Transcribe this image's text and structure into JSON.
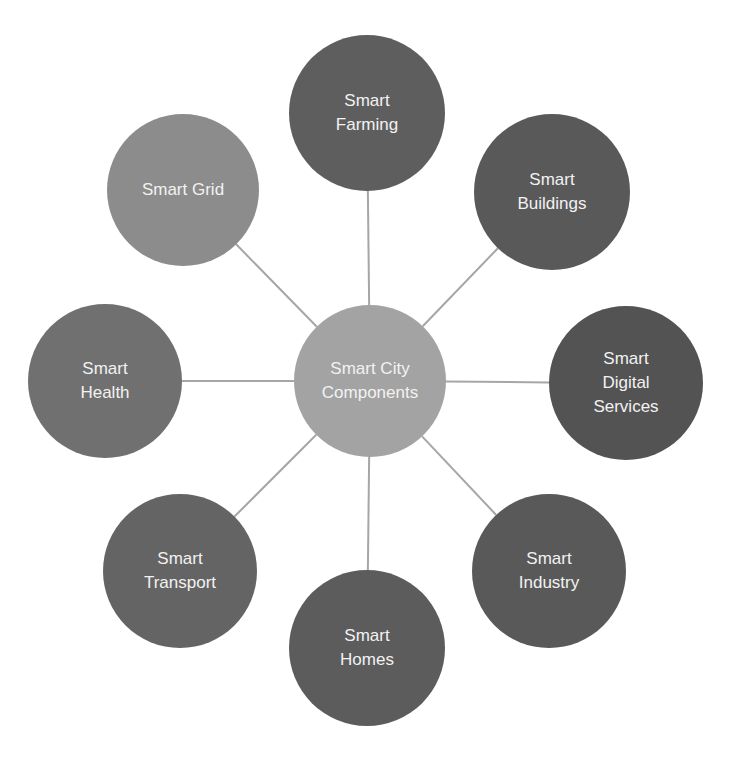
{
  "diagram": {
    "type": "hub-and-spoke",
    "center": {
      "label": "Smart City\nComponents",
      "cx": 370,
      "cy": 381,
      "r": 76,
      "color": "#a3a3a3"
    },
    "line_color": "#a6a6a6",
    "nodes": [
      {
        "id": "farming",
        "label": "Smart\nFarming",
        "cx": 367,
        "cy": 113,
        "r": 78,
        "color": "#5e5e5e"
      },
      {
        "id": "buildings",
        "label": "Smart\nBuildings",
        "cx": 552,
        "cy": 192,
        "r": 78,
        "color": "#595959"
      },
      {
        "id": "digital-services",
        "label": "Smart\nDigital\nServices",
        "cx": 626,
        "cy": 383,
        "r": 77,
        "color": "#535353"
      },
      {
        "id": "industry",
        "label": "Smart\nIndustry",
        "cx": 549,
        "cy": 571,
        "r": 77,
        "color": "#595959"
      },
      {
        "id": "homes",
        "label": "Smart\nHomes",
        "cx": 367,
        "cy": 648,
        "r": 78,
        "color": "#5c5c5c"
      },
      {
        "id": "transport",
        "label": "Smart\nTransport",
        "cx": 180,
        "cy": 571,
        "r": 77,
        "color": "#646464"
      },
      {
        "id": "health",
        "label": "Smart\nHealth",
        "cx": 105,
        "cy": 381,
        "r": 77,
        "color": "#707070"
      },
      {
        "id": "grid",
        "label": "Smart Grid",
        "cx": 183,
        "cy": 190,
        "r": 76,
        "color": "#8c8c8c"
      }
    ]
  }
}
